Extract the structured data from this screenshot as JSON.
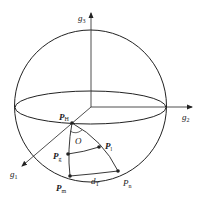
{
  "figure": {
    "type": "spherical-coordinate-diagram",
    "axes": {
      "g1": {
        "label": "g",
        "sub": "1"
      },
      "g2": {
        "label": "g",
        "sub": "2"
      },
      "g3": {
        "label": "g",
        "sub": "3"
      }
    },
    "center_label": "O",
    "points": {
      "PH": {
        "label": "P",
        "sub": "H"
      },
      "Pl": {
        "label": "P",
        "sub": "l"
      },
      "Pg": {
        "label": "P",
        "sub": "g"
      },
      "Pm": {
        "label": "P",
        "sub": "m"
      },
      "Pn": {
        "label": "P",
        "sub": "n"
      }
    },
    "distance_label": {
      "label": "d",
      "sub": "T"
    },
    "colors": {
      "stroke": "#222222",
      "background": "#ffffff"
    }
  }
}
